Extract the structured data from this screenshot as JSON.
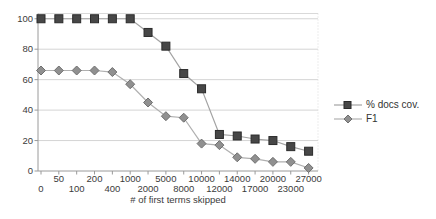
{
  "chart_data": {
    "type": "line",
    "title": "",
    "xlabel": "# of first terms skipped",
    "ylabel": "",
    "ylim": [
      0,
      100
    ],
    "y_ticks": [
      0,
      20,
      40,
      60,
      80,
      100
    ],
    "grid": true,
    "legend_position": "right",
    "categories": [
      "0",
      "50",
      "100",
      "200",
      "400",
      "1000",
      "2000",
      "5000",
      "8000",
      "10000",
      "12000",
      "14000",
      "17000",
      "20000",
      "23000",
      "27000"
    ],
    "series": [
      {
        "name": "% docs cov.",
        "marker": "square",
        "values": [
          100,
          100,
          100,
          100,
          100,
          100,
          91,
          82,
          64,
          54,
          24,
          23,
          21,
          20,
          16,
          13
        ],
        "line_color": "#a3a3a3",
        "marker_fill": "#474747",
        "marker_stroke": "#2b2b2b"
      },
      {
        "name": "F1",
        "marker": "diamond",
        "values": [
          66,
          66,
          66,
          66,
          65,
          57,
          45,
          36,
          35,
          18,
          17,
          9,
          8,
          6,
          6,
          2
        ],
        "line_color": "#b0b0b0",
        "marker_fill": "#909090",
        "marker_stroke": "#6f6f6f"
      }
    ],
    "colors": {
      "background": "#ffffff",
      "gridline": "#d4d4d4",
      "frame": "#d9d9d9",
      "axis": "#9a9a9a",
      "tick_label": "#3b3b3b",
      "axis_title": "#3b3b3b",
      "legend_text": "#333333"
    }
  }
}
